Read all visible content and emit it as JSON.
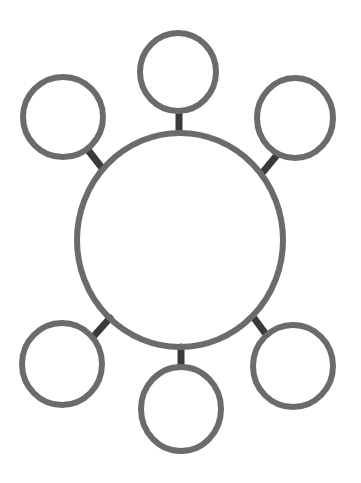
{
  "diagram": {
    "type": "bubble-map",
    "background": "#ffffff",
    "stroke_color": "#6b6b6b",
    "connector_color": "#3a3a3a",
    "center": {
      "cx": 180,
      "cy": 240,
      "rx": 103,
      "ry": 107,
      "stroke_width": 6
    },
    "satellites": [
      {
        "id": "top",
        "cx": 178,
        "cy": 72,
        "rx": 38,
        "ry": 39
      },
      {
        "id": "top-left",
        "cx": 63,
        "cy": 117,
        "rx": 40,
        "ry": 40
      },
      {
        "id": "top-right",
        "cx": 295,
        "cy": 118,
        "rx": 38,
        "ry": 40
      },
      {
        "id": "bottom-left",
        "cx": 62,
        "cy": 364,
        "rx": 40,
        "ry": 41
      },
      {
        "id": "bottom",
        "cx": 181,
        "cy": 409,
        "rx": 40,
        "ry": 42
      },
      {
        "id": "bottom-right",
        "cx": 293,
        "cy": 366,
        "rx": 40,
        "ry": 41
      }
    ],
    "connectors": [
      {
        "id": "top",
        "x1": 179,
        "y1": 112,
        "x2": 179,
        "y2": 132
      },
      {
        "id": "top-left",
        "x1": 88,
        "y1": 150,
        "x2": 102,
        "y2": 168
      },
      {
        "id": "top-right",
        "x1": 277,
        "y1": 155,
        "x2": 263,
        "y2": 172
      },
      {
        "id": "bottom-left",
        "x1": 93,
        "y1": 337,
        "x2": 110,
        "y2": 318
      },
      {
        "id": "bottom",
        "x1": 181,
        "y1": 347,
        "x2": 181,
        "y2": 369
      },
      {
        "id": "bottom-right",
        "x1": 254,
        "y1": 318,
        "x2": 268,
        "y2": 337
      }
    ]
  }
}
